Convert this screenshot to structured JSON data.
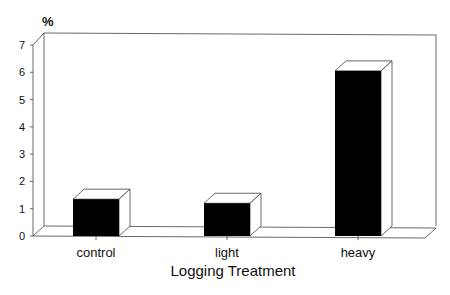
{
  "chart_data": {
    "type": "bar",
    "style": "3d",
    "title": "",
    "xlabel": "Logging Treatment",
    "ylabel": "%",
    "categories": [
      "control",
      "light",
      "heavy"
    ],
    "values": [
      1.35,
      1.2,
      6.05
    ],
    "ylim": [
      0,
      7
    ],
    "yticks": [
      0,
      1,
      2,
      3,
      4,
      5,
      6,
      7
    ],
    "grid": false,
    "legend": null,
    "bar_color": "#000000"
  }
}
